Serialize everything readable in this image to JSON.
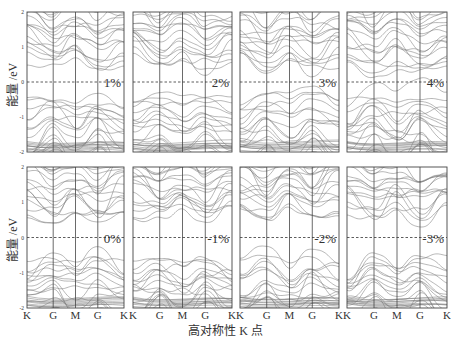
{
  "chart_data": {
    "type": "line",
    "title": "",
    "xlabel": "高对称性 K 点",
    "ylabel": "能量 /eV",
    "ylim": [
      -2,
      2
    ],
    "yticks": [
      "2",
      "1",
      "0",
      "-1",
      "-2"
    ],
    "k_path": [
      "K",
      "G",
      "M",
      "G",
      "K"
    ],
    "k_positions": [
      0,
      0.27,
      0.5,
      0.73,
      1.0
    ],
    "fermi_level": 0,
    "fermi_line_style": "dashed",
    "grid": false,
    "layout": {
      "rows": 2,
      "cols": 4
    },
    "panels": [
      {
        "row": 0,
        "col": 0,
        "strain_label": "1%",
        "gap_eV": 0.9
      },
      {
        "row": 0,
        "col": 1,
        "strain_label": "2%",
        "gap_eV": 0.75
      },
      {
        "row": 0,
        "col": 2,
        "strain_label": "3%",
        "gap_eV": 0.6
      },
      {
        "row": 0,
        "col": 3,
        "strain_label": "4%",
        "gap_eV": 0.45
      },
      {
        "row": 1,
        "col": 0,
        "strain_label": "0%",
        "gap_eV": 1.0
      },
      {
        "row": 1,
        "col": 1,
        "strain_label": "-1%",
        "gap_eV": 1.05
      },
      {
        "row": 1,
        "col": 2,
        "strain_label": "-2%",
        "gap_eV": 1.1
      },
      {
        "row": 1,
        "col": 3,
        "strain_label": "-3%",
        "gap_eV": 1.15
      }
    ]
  },
  "colors": {
    "band_line": "#7a7a7a",
    "axis": "#444444",
    "fermi": "#333333",
    "text": "#333333"
  }
}
